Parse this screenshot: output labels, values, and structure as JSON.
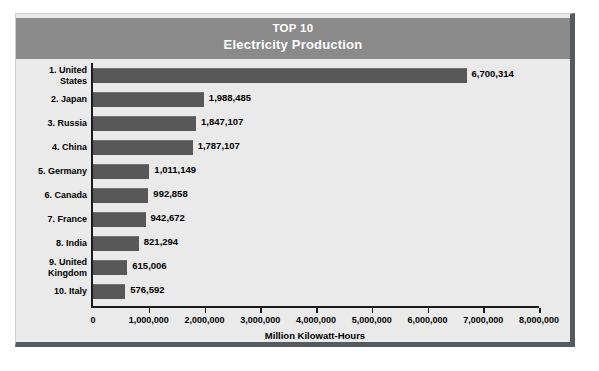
{
  "title": {
    "line1": "TOP 10",
    "line2": "Electricity Production"
  },
  "colors": {
    "header_band": "#8a8a8a",
    "bar": "#585858",
    "panel_background": "#eaeaea",
    "panel_border": "#555a5e",
    "axis": "#1a1a1a",
    "title_text": "#ffffff"
  },
  "chart_data": {
    "type": "bar",
    "orientation": "horizontal",
    "title": "TOP 10 Electricity Production",
    "subtitle": "Electricity Production",
    "xlabel": "Million Kilowatt-Hours",
    "ylabel": "",
    "xlim": [
      0,
      8000000
    ],
    "grid": false,
    "legend": "none",
    "xticks": [
      0,
      1000000,
      2000000,
      3000000,
      4000000,
      5000000,
      6000000,
      7000000,
      8000000
    ],
    "xticklabels": [
      "0",
      "1,000,000",
      "2,000,000",
      "3,000,000",
      "4,000,000",
      "5,000,000",
      "6,000,000",
      "7,000,000",
      "8,000,000"
    ],
    "categories": [
      "1. United States",
      "2. Japan",
      "3. Russia",
      "4. China",
      "5. Germany",
      "6. Canada",
      "7. France",
      "8. India",
      "9. United Kingdom",
      "10. Italy"
    ],
    "values": [
      6700314,
      1988485,
      1847107,
      1787107,
      1011149,
      992858,
      942672,
      821294,
      615006,
      576592
    ],
    "data_labels": [
      "6,700,314",
      "1,988,485",
      "1,847,107",
      "1,787,107",
      "1,011,149",
      "992,858",
      "942,672",
      "821,294",
      "615,006",
      "576,592"
    ]
  },
  "rows": [
    {
      "rank_label": "1. United\nStates",
      "value": 6700314,
      "value_label": "6,700,314"
    },
    {
      "rank_label": "2. Japan",
      "value": 1988485,
      "value_label": "1,988,485"
    },
    {
      "rank_label": "3. Russia",
      "value": 1847107,
      "value_label": "1,847,107"
    },
    {
      "rank_label": "4. China",
      "value": 1787107,
      "value_label": "1,787,107"
    },
    {
      "rank_label": "5. Germany",
      "value": 1011149,
      "value_label": "1,011,149"
    },
    {
      "rank_label": "6. Canada",
      "value": 992858,
      "value_label": "992,858"
    },
    {
      "rank_label": "7. France",
      "value": 942672,
      "value_label": "942,672"
    },
    {
      "rank_label": "8. India",
      "value": 821294,
      "value_label": "821,294"
    },
    {
      "rank_label": "9. United\nKingdom",
      "value": 615006,
      "value_label": "615,006"
    },
    {
      "rank_label": "10. Italy",
      "value": 576592,
      "value_label": "576,592"
    }
  ],
  "axis": {
    "title": "Million Kilowatt-Hours",
    "ticks": [
      "0",
      "1,000,000",
      "2,000,000",
      "3,000,000",
      "4,000,000",
      "5,000,000",
      "6,000,000",
      "7,000,000",
      "8,000,000"
    ]
  }
}
